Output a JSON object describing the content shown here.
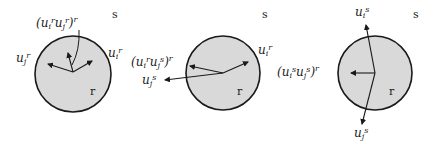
{
  "diagram": {
    "colors": {
      "circle_fill": "#d9d9d9",
      "stroke": "#1a1a1a",
      "background": "#ffffff"
    },
    "panels": [
      {
        "outer_label": "s",
        "inner_label": "r",
        "labels": {
          "product": "(u_i^r u_j^r)^r",
          "ui": "u_i^r",
          "uj": "u_j^r"
        }
      },
      {
        "outer_label": "s",
        "inner_label": "r",
        "labels": {
          "product": "(u_i^r u_j^s)^r",
          "ui": "u_i^r",
          "uj": "u_j^s"
        }
      },
      {
        "outer_label": "s",
        "inner_label": "r",
        "labels": {
          "product": "(u_i^s u_j^s)^r",
          "ui": "u_i^s",
          "uj": "u_j^s"
        }
      }
    ]
  }
}
